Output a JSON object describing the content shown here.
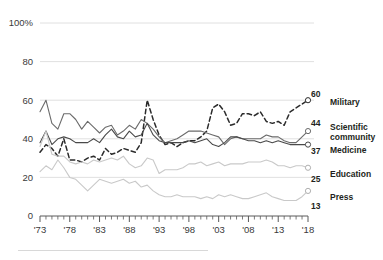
{
  "chart_data": {
    "type": "line",
    "title": "",
    "subtitle": "",
    "xlabel": "",
    "ylabel": "",
    "xlim": [
      1973,
      2018
    ],
    "ylim": [
      0,
      100
    ],
    "grid": true,
    "legend_position": "right-end-of-line",
    "y_ticks": [
      "100%",
      "80",
      "60",
      "40",
      "20",
      "0"
    ],
    "y_tick_values": [
      100,
      80,
      60,
      40,
      20,
      0
    ],
    "x_ticks": [
      "'73",
      "'78",
      "'83",
      "'88",
      "'93",
      "'98",
      "'03",
      "'08",
      "'13",
      "'18"
    ],
    "x_tick_values": [
      1973,
      1978,
      1983,
      1988,
      1993,
      1998,
      2003,
      2008,
      2013,
      2018
    ],
    "x_minor_tick_step": 1,
    "x": [
      1973,
      1974,
      1975,
      1976,
      1977,
      1978,
      1979,
      1980,
      1981,
      1982,
      1983,
      1984,
      1985,
      1986,
      1987,
      1988,
      1989,
      1990,
      1991,
      1992,
      1993,
      1994,
      1995,
      1996,
      1997,
      1998,
      1999,
      2000,
      2001,
      2002,
      2003,
      2004,
      2005,
      2006,
      2007,
      2008,
      2009,
      2010,
      2011,
      2012,
      2013,
      2014,
      2015,
      2016,
      2017,
      2018
    ],
    "series": [
      {
        "name": "Military",
        "style": "dashed",
        "color": "#2b2b2b",
        "end_value": 60,
        "end_label": "60",
        "values": [
          33,
          37,
          35,
          31,
          40,
          29,
          29,
          28,
          30,
          31,
          29,
          35,
          32,
          33,
          35,
          34,
          33,
          38,
          60,
          50,
          42,
          37,
          38,
          36,
          38,
          39,
          39,
          41,
          44,
          56,
          58,
          54,
          47,
          48,
          53,
          53,
          52,
          54,
          49,
          48,
          49,
          47,
          54,
          56,
          58,
          60
        ]
      },
      {
        "name": "Scientific community",
        "style": "solid",
        "color": "#6b6b6b",
        "end_value": 44,
        "end_label": "44",
        "values": [
          54,
          60,
          48,
          45,
          53,
          53,
          50,
          45,
          49,
          46,
          43,
          46,
          47,
          42,
          44,
          47,
          45,
          50,
          48,
          45,
          41,
          38,
          39,
          40,
          42,
          44,
          44,
          44,
          43,
          42,
          41,
          37,
          40,
          41,
          40,
          40,
          40,
          40,
          42,
          41,
          41,
          39,
          38,
          38,
          41,
          44
        ]
      },
      {
        "name": "Medicine",
        "style": "solid",
        "color": "#4a4a4a",
        "end_value": 37,
        "end_label": "37",
        "values": [
          38,
          44,
          37,
          40,
          41,
          40,
          38,
          38,
          38,
          40,
          38,
          42,
          45,
          41,
          40,
          44,
          41,
          42,
          48,
          42,
          39,
          38,
          38,
          38,
          38,
          39,
          38,
          39,
          40,
          37,
          36,
          38,
          41,
          41,
          40,
          39,
          39,
          38,
          39,
          38,
          39,
          38,
          37,
          37,
          37,
          37
        ]
      },
      {
        "name": "Education",
        "style": "solid",
        "color": "#c9c9c9",
        "end_value": 25,
        "end_label": "25",
        "values": [
          36,
          44,
          32,
          31,
          31,
          28,
          27,
          28,
          27,
          29,
          28,
          29,
          30,
          29,
          31,
          27,
          25,
          26,
          30,
          29,
          22,
          24,
          24,
          24,
          25,
          27,
          27,
          28,
          26,
          27,
          28,
          26,
          27,
          27,
          27,
          28,
          28,
          28,
          29,
          28,
          26,
          26,
          25,
          26,
          26,
          25
        ]
      },
      {
        "name": "Press",
        "style": "solid",
        "color": "#c9c9c9",
        "end_value": 13,
        "end_label": "13",
        "values": [
          23,
          26,
          24,
          29,
          25,
          20,
          19,
          16,
          13,
          16,
          19,
          18,
          17,
          18,
          19,
          17,
          18,
          15,
          16,
          13,
          11,
          10,
          10,
          11,
          10,
          10,
          10,
          9,
          10,
          9,
          11,
          10,
          11,
          10,
          9,
          9,
          10,
          11,
          12,
          10,
          9,
          8,
          8,
          8,
          10,
          13
        ]
      }
    ]
  }
}
